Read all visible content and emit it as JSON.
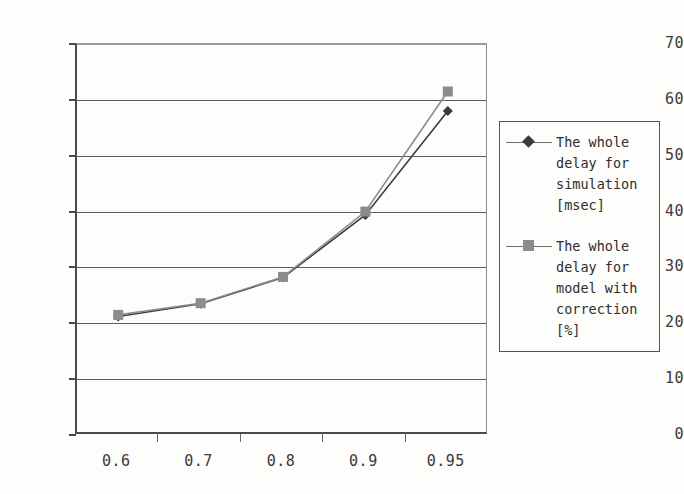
{
  "chart_data": {
    "type": "line",
    "title": "",
    "xlabel": "",
    "ylabel": "",
    "categories": [
      "0.6",
      "0.7",
      "0.8",
      "0.9",
      "0.95"
    ],
    "ylim": [
      0,
      70
    ],
    "ytick_labels": [
      "0",
      "10",
      "20",
      "30",
      "40",
      "50",
      "60",
      "70"
    ],
    "ytick_values": [
      0,
      10,
      20,
      30,
      40,
      50,
      60,
      70
    ],
    "grid": "horizontal",
    "legend_position": "right",
    "series": [
      {
        "name": "The whole\ndelay for\nsimulation\n[msec]",
        "marker": "diamond",
        "color": "#3b3b3b",
        "values": [
          21.2,
          23.5,
          28.2,
          39.4,
          58.0
        ]
      },
      {
        "name": "The whole\ndelay for\nmodel with\ncorrection\n[%]",
        "marker": "square",
        "color": "#8c8c8c",
        "values": [
          21.5,
          23.6,
          28.3,
          40.0,
          61.5
        ]
      }
    ]
  },
  "legend": {
    "entries": [
      {
        "label": "The whole\ndelay for\nsimulation\n[msec]"
      },
      {
        "label": "The whole\ndelay for\nmodel with\ncorrection\n[%]"
      }
    ]
  },
  "axes": {
    "y_labels": [
      "70",
      "60",
      "50",
      "40",
      "30",
      "20",
      "10",
      "0"
    ],
    "x_labels": [
      "0.6",
      "0.7",
      "0.8",
      "0.9",
      "0.95"
    ]
  }
}
